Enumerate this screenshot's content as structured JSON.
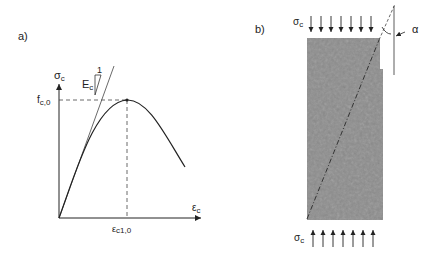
{
  "panel_a": {
    "label": "a)",
    "y_axis_label": "σ",
    "y_axis_sub": "c",
    "x_axis_label": "ε",
    "x_axis_sub": "c",
    "peak_stress_label": "f",
    "peak_stress_sub": "c,0",
    "peak_strain_label": "ε",
    "peak_strain_sub": "c1,0",
    "modulus_label": "E",
    "modulus_sub": "c",
    "slope_label": "1"
  },
  "panel_b": {
    "label": "b)",
    "top_load_label": "σ",
    "top_load_sub": "c",
    "bottom_load_label": "σ",
    "bottom_load_sub": "c",
    "angle_label": "α",
    "arrow_count": 7
  },
  "colors": {
    "line": "#222222",
    "specimen": "#8c8c8c",
    "crack": "#333333"
  }
}
